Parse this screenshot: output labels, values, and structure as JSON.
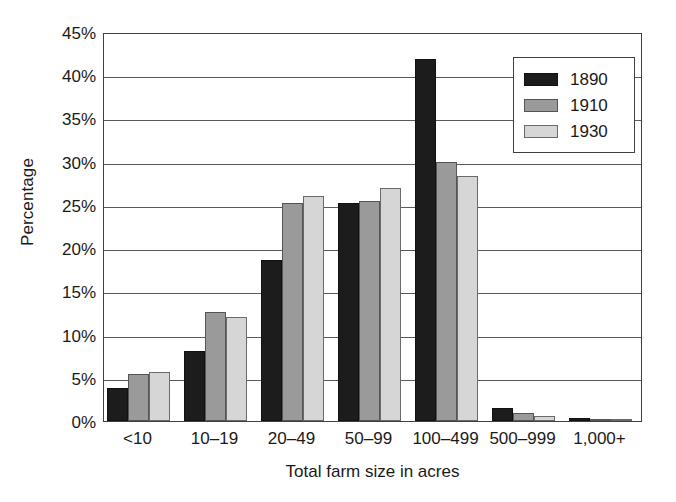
{
  "chart_data": {
    "type": "bar",
    "title": "",
    "xlabel": "Total farm size in acres",
    "ylabel": "Percentage",
    "categories": [
      "<10",
      "10–19",
      "20–49",
      "50–99",
      "100–499",
      "500–999",
      "1,000+"
    ],
    "series": [
      {
        "name": "1890",
        "color": "#1c1c1c",
        "values": [
          3.8,
          8.1,
          18.6,
          25.2,
          41.9,
          1.5,
          0.3
        ]
      },
      {
        "name": "1910",
        "color": "#9a9a9a",
        "values": [
          5.4,
          12.6,
          25.2,
          25.5,
          30.0,
          0.9,
          0.15
        ]
      },
      {
        "name": "1930",
        "color": "#d6d6d6",
        "values": [
          5.7,
          12.0,
          26.0,
          27.0,
          28.3,
          0.6,
          0.1
        ]
      }
    ],
    "ylim": [
      0,
      45
    ],
    "ytick_values": [
      0,
      5,
      10,
      15,
      20,
      25,
      30,
      35,
      40,
      45
    ],
    "ytick_labels": [
      "0%",
      "5%",
      "10%",
      "15%",
      "20%",
      "25%",
      "30%",
      "35%",
      "40%",
      "45%"
    ],
    "grid": "horizontal",
    "legend_position": "top-right",
    "legend_entries": [
      "1890",
      "1910",
      "1930"
    ]
  }
}
